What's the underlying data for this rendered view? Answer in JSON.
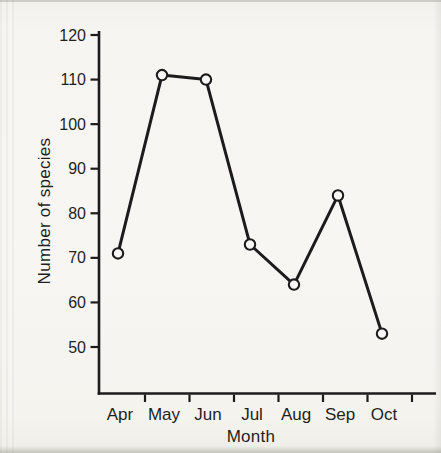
{
  "chart_data": {
    "type": "line",
    "title": "",
    "xlabel": "Month",
    "ylabel": "Number of species",
    "categories": [
      "Apr",
      "May",
      "Jun",
      "Jul",
      "Aug",
      "Sep",
      "Oct"
    ],
    "values": [
      71,
      111,
      110,
      73,
      64,
      84,
      53
    ],
    "yticks": [
      50,
      60,
      70,
      80,
      90,
      100,
      110,
      120
    ],
    "ylim": [
      45,
      123
    ],
    "grid": false,
    "legend": "none",
    "marker": "open-circle",
    "colors": {
      "ink": "#1c1c1c",
      "paper": "#f6f5f1",
      "marker_fill": "#f8f7f3",
      "text": "#1f1f1f"
    }
  }
}
